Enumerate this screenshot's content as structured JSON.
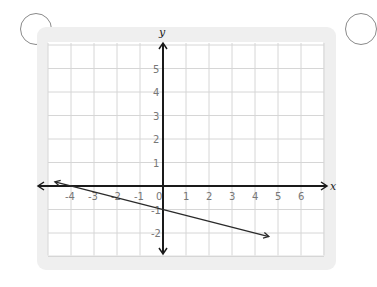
{
  "chart_data": {
    "type": "line",
    "title": "",
    "xlabel": "x",
    "ylabel": "y",
    "xlim": [
      -5,
      7
    ],
    "ylim": [
      -3,
      6
    ],
    "grid": true,
    "x_ticks": [
      "-4",
      "-3",
      "-2",
      "-1",
      "0",
      "1",
      "2",
      "3",
      "4",
      "5",
      "6"
    ],
    "y_ticks": [
      "5",
      "4",
      "3",
      "2",
      "1",
      "-1",
      "-2"
    ],
    "series": [
      {
        "name": "line",
        "equation": "y = -x/4 - 1",
        "x": [
          -4.7,
          4.6
        ],
        "y": [
          0.175,
          -2.15
        ],
        "arrows": "both"
      }
    ]
  },
  "labels": {
    "x_axis": "x",
    "y_axis": "y",
    "origin": "0"
  },
  "colors": {
    "grid": "#d6d6d6",
    "axis": "#1a1a1a",
    "card": "#efefef",
    "tick_text": "#777777"
  }
}
